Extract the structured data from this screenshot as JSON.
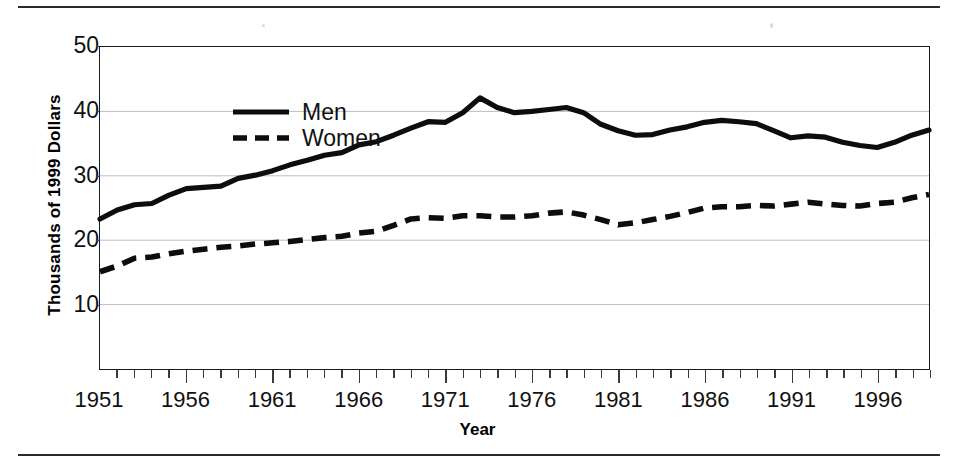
{
  "figure": {
    "top_rule": "horizontal-rule",
    "bottom_rule": "horizontal-rule"
  },
  "axes": {
    "y_title": "Thousands of 1999 Dollars",
    "x_title": "Year",
    "y_ticks": [
      "10",
      "20",
      "30",
      "40",
      "50"
    ],
    "x_ticks": [
      "1951",
      "1956",
      "1961",
      "1966",
      "1971",
      "1976",
      "1981",
      "1986",
      "1991",
      "1996"
    ]
  },
  "legend": {
    "items": [
      {
        "label": "Men",
        "style": "solid",
        "color": "#0d0d0d"
      },
      {
        "label": "Women",
        "style": "dashed",
        "color": "#0d0d0d"
      }
    ]
  },
  "chart_data": {
    "type": "line",
    "title": "",
    "subtitle": "",
    "xlabel": "Year",
    "ylabel": "Thousands of 1999 Dollars",
    "xlim": [
      1951,
      1999
    ],
    "ylim": [
      0,
      50
    ],
    "yticks": [
      10,
      20,
      30,
      40,
      50
    ],
    "xticks_major": [
      1951,
      1956,
      1961,
      1966,
      1971,
      1976,
      1981,
      1986,
      1991,
      1996
    ],
    "grid": "horizontal",
    "legend_position": "top-left-inside",
    "x": [
      1951,
      1952,
      1953,
      1954,
      1955,
      1956,
      1957,
      1958,
      1959,
      1960,
      1961,
      1962,
      1963,
      1964,
      1965,
      1966,
      1967,
      1968,
      1969,
      1970,
      1971,
      1972,
      1973,
      1974,
      1975,
      1976,
      1977,
      1978,
      1979,
      1980,
      1981,
      1982,
      1983,
      1984,
      1985,
      1986,
      1987,
      1988,
      1989,
      1990,
      1991,
      1992,
      1993,
      1994,
      1995,
      1996,
      1997,
      1998,
      1999
    ],
    "series": [
      {
        "name": "Men",
        "style": "solid",
        "color": "#0d0d0d",
        "values": [
          23.3,
          24.7,
          25.5,
          25.7,
          27.0,
          28.0,
          28.2,
          28.4,
          29.6,
          30.1,
          30.8,
          31.7,
          32.4,
          33.2,
          33.6,
          34.8,
          35.3,
          36.3,
          37.4,
          38.4,
          38.3,
          39.8,
          42.1,
          40.6,
          39.8,
          40.0,
          40.3,
          40.6,
          39.8,
          38.0,
          37.0,
          36.3,
          36.4,
          37.1,
          37.6,
          38.3,
          38.6,
          38.4,
          38.1,
          37.0,
          35.9,
          36.2,
          36.0,
          35.2,
          34.7,
          34.4,
          35.2,
          36.3,
          37.1
        ]
      },
      {
        "name": "Women",
        "style": "dashed",
        "color": "#0d0d0d",
        "values": [
          15.1,
          16.0,
          17.2,
          17.4,
          17.9,
          18.3,
          18.6,
          18.9,
          19.1,
          19.4,
          19.6,
          19.8,
          20.1,
          20.4,
          20.6,
          21.1,
          21.4,
          22.3,
          23.3,
          23.5,
          23.4,
          23.8,
          23.8,
          23.6,
          23.6,
          23.8,
          24.2,
          24.4,
          23.9,
          23.2,
          22.4,
          22.7,
          23.2,
          23.7,
          24.3,
          25.0,
          25.2,
          25.2,
          25.4,
          25.3,
          25.6,
          25.9,
          25.6,
          25.4,
          25.3,
          25.7,
          25.9,
          26.6,
          27.1
        ]
      }
    ]
  }
}
